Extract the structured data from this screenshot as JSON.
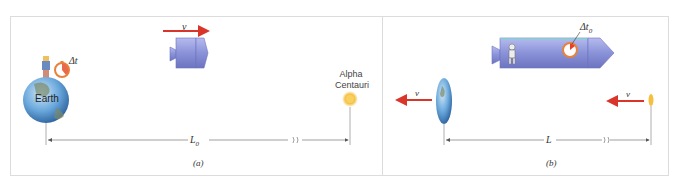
{
  "figure": {
    "panels": [
      {
        "id": "a",
        "caption": "(a)",
        "earth_label": "Earth",
        "clock_label": "Δt",
        "velocity_label": "v",
        "star_label_line1": "Alpha",
        "star_label_line2": "Centauri",
        "distance_label": "L",
        "distance_subscript": "0"
      },
      {
        "id": "b",
        "caption": "(b)",
        "clock_label": "Δt",
        "clock_subscript": "0",
        "earth_velocity_label": "v",
        "star_velocity_label": "v",
        "distance_label": "L"
      }
    ],
    "colors": {
      "arrow": "#d9352b",
      "ship": "#8a92d8",
      "earth_blue": "#4a90d0",
      "star": "#f5c040",
      "clock": "#e8823a",
      "line": "#555555"
    }
  }
}
